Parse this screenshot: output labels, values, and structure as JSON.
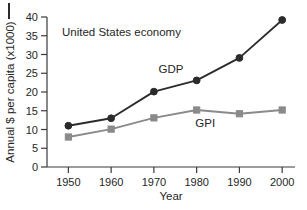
{
  "chart_data": {
    "type": "line",
    "title": "",
    "annotation": "United States economy",
    "xlabel": "Year",
    "ylabel": "Annual $ per capita (x1000)",
    "x": [
      1950,
      1960,
      1970,
      1980,
      1990,
      2000
    ],
    "xtick_labels": [
      "1950",
      "1960",
      "1970",
      "1980",
      "1990",
      "2000"
    ],
    "ytick_labels": [
      "0",
      "5",
      "10",
      "15",
      "20",
      "25",
      "30",
      "35",
      "40"
    ],
    "yticks": [
      0,
      5,
      10,
      15,
      20,
      25,
      30,
      35,
      40
    ],
    "xlim": [
      1945,
      2003
    ],
    "ylim": [
      0,
      40
    ],
    "grid": false,
    "legend": "inline-labels",
    "series": [
      {
        "name": "GDP",
        "label": "GDP",
        "color": "#2b2b2b",
        "marker": "circle",
        "values": [
          11.0,
          13.0,
          20.1,
          23.1,
          29.1,
          39.2
        ],
        "label_x": 1974,
        "label_y": 25.0
      },
      {
        "name": "GPI",
        "label": "GPI",
        "color": "#8a8a8a",
        "marker": "square",
        "values": [
          8.0,
          10.1,
          13.1,
          15.2,
          14.2,
          15.2
        ],
        "label_x": 1982,
        "label_y": 10.6
      }
    ]
  },
  "figure": {
    "axis_color": "#3a3a3a",
    "background": "#ffffff"
  }
}
